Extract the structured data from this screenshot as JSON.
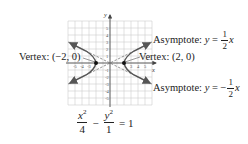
{
  "figure": {
    "axis_labels": {
      "x": "x",
      "y": "y"
    },
    "x_ticks": [
      "-5",
      "-4",
      "-3",
      "3",
      "4",
      "5"
    ],
    "y_ticks": [
      "5",
      "4",
      "3",
      "2",
      "1",
      "-1",
      "-2",
      "-3",
      "-4",
      "-5"
    ],
    "grid_range": {
      "xmin": -6,
      "xmax": 6,
      "ymin": -6,
      "ymax": 6
    },
    "vertex_left": {
      "label": "Vertex: (−2, 0)",
      "x": -2,
      "y": 0
    },
    "vertex_right": {
      "label": "Vertex: (2, 0)",
      "x": 2,
      "y": 0
    },
    "asymptote_pos": {
      "prefix": "Asymptote: ",
      "var": "y",
      "equals": " = ",
      "sign": "",
      "num": "1",
      "den": "2",
      "suffix": "x"
    },
    "asymptote_neg": {
      "prefix": "Asymptote: ",
      "var": "y",
      "equals": " = ",
      "sign": "−",
      "num": "1",
      "den": "2",
      "suffix": "x"
    },
    "equation": {
      "term1_num": "x",
      "term1_exp": "2",
      "term1_den": "4",
      "minus": "−",
      "term2_num": "y",
      "term2_exp": "2",
      "term2_den": "1",
      "rhs": "= 1"
    },
    "colors": {
      "grid": "#cfcfcf",
      "axis": "#444444",
      "curve": "#555555",
      "asymptote": "#777777",
      "text": "#222222"
    }
  }
}
